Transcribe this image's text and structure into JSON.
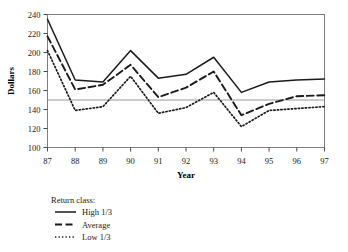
{
  "chart_data": {
    "type": "line",
    "title": "",
    "xlabel": "Year",
    "ylabel": "Dollars",
    "x": [
      "87",
      "88",
      "89",
      "90",
      "91",
      "92",
      "93",
      "94",
      "95",
      "96",
      "97"
    ],
    "xlim": [
      87,
      97
    ],
    "ylim": [
      100,
      240
    ],
    "yticks": [
      100,
      120,
      140,
      160,
      180,
      200,
      220,
      240
    ],
    "xticks": [
      "87",
      "88",
      "89",
      "90",
      "91",
      "92",
      "93",
      "94",
      "95",
      "96",
      "97"
    ],
    "grid": false,
    "reference_line": {
      "value": 150,
      "color": "#9a9a9a",
      "label": ""
    },
    "legend_position": "below-left",
    "legend_title": "Return class:",
    "series": [
      {
        "name": "High 1/3",
        "style": "solid",
        "color": "#1a1a1a",
        "values": [
          235,
          171,
          169,
          202,
          173,
          177,
          195,
          158,
          169,
          171,
          172
        ]
      },
      {
        "name": "Average",
        "style": "dashed",
        "color": "#1a1a1a",
        "values": [
          217,
          161,
          166,
          187,
          153,
          163,
          180,
          134,
          146,
          154,
          155
        ]
      },
      {
        "name": "Low 1/3",
        "style": "dotted",
        "color": "#1a1a1a",
        "values": [
          202,
          139,
          143,
          175,
          136,
          142,
          158,
          122,
          139,
          141,
          143
        ]
      }
    ]
  },
  "axis": {
    "ylabel_text": "Dollars",
    "xlabel_text": "Year",
    "ytick_0": "100",
    "ytick_1": "120",
    "ytick_2": "140",
    "ytick_3": "160",
    "ytick_4": "180",
    "ytick_5": "200",
    "ytick_6": "220",
    "ytick_7": "240",
    "xtick_0": "87",
    "xtick_1": "88",
    "xtick_2": "89",
    "xtick_3": "90",
    "xtick_4": "91",
    "xtick_5": "92",
    "xtick_6": "93",
    "xtick_7": "94",
    "xtick_8": "95",
    "xtick_9": "96",
    "xtick_10": "97"
  },
  "legend": {
    "title": "Return class:",
    "items": [
      {
        "label": "High 1/3",
        "style": "solid"
      },
      {
        "label": "Average",
        "style": "dashed"
      },
      {
        "label": "Low 1/3",
        "style": "dotted"
      }
    ]
  },
  "colors": {
    "line": "#1a1a1a",
    "frame": "#7d7d7d",
    "reference": "#9a9a9a",
    "background": "#ffffff"
  }
}
